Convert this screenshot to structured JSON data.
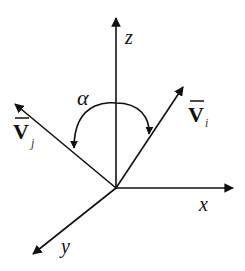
{
  "diagram": {
    "type": "3d-coordinate-axes-with-vectors",
    "colors": {
      "line": "#111111",
      "background": "#ffffff"
    },
    "axes": [
      {
        "id": "z",
        "label": "z"
      },
      {
        "id": "x",
        "label": "x"
      },
      {
        "id": "y",
        "label": "y"
      }
    ],
    "vectors": [
      {
        "id": "Vi",
        "symbol": "V",
        "subscript": "i",
        "overbar": true
      },
      {
        "id": "Vj",
        "symbol": "V",
        "subscript": "j",
        "overbar": true
      }
    ],
    "angle": {
      "symbol": "α",
      "between": [
        "Vj",
        "Vi"
      ],
      "arc": "double-headed"
    }
  }
}
